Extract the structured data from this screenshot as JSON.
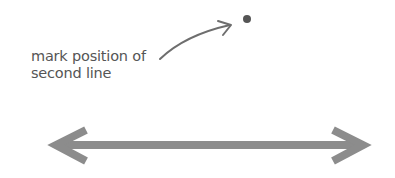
{
  "annotation": {
    "line1": "mark position of",
    "line2": "second line"
  },
  "colors": {
    "text": "#555555",
    "dot": "#555555",
    "pointer_arrow": "#6e6e6e",
    "double_arrow": "#8c8c8c",
    "background": "#ffffff"
  },
  "elements": {
    "dot": {
      "cx": 247,
      "cy": 19,
      "r": 4
    },
    "double_arrow": {
      "x1": 52,
      "x2": 367,
      "y": 145
    }
  }
}
